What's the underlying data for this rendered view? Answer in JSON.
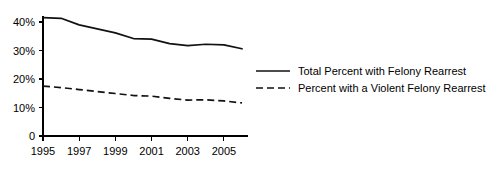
{
  "chart_data": {
    "type": "line",
    "title": "",
    "xlabel": "",
    "ylabel": "",
    "grid": false,
    "legend_position": "right",
    "x": [
      1995,
      1996,
      1997,
      1998,
      1999,
      2000,
      2001,
      2002,
      2003,
      2004,
      2005,
      2006
    ],
    "xlim": [
      1995,
      2006
    ],
    "ylim": [
      0,
      42
    ],
    "x_tick_labels": [
      "1995",
      "1997",
      "1999",
      "2001",
      "2003",
      "2005"
    ],
    "x_tick_values": [
      1995,
      1997,
      1999,
      2001,
      2003,
      2005
    ],
    "y_tick_labels": [
      "0",
      "10%",
      "20%",
      "30%",
      "40%"
    ],
    "y_tick_values": [
      0,
      10,
      20,
      30,
      40
    ],
    "series": [
      {
        "name": "Total Percent with Felony Rearrest",
        "style": "solid",
        "color": "#111111",
        "values": [
          41.5,
          41.3,
          39.0,
          37.6,
          36.2,
          34.2,
          34.0,
          32.4,
          31.7,
          32.2,
          32.0,
          30.6
        ]
      },
      {
        "name": "Percent with a Violent Felony Rearrest",
        "style": "dashed",
        "color": "#111111",
        "values": [
          17.5,
          17.0,
          16.3,
          15.6,
          14.9,
          14.2,
          14.0,
          13.2,
          12.6,
          12.7,
          12.3,
          11.6
        ]
      }
    ]
  },
  "legend": {
    "items": [
      {
        "label": "Total Percent with Felony Rearrest",
        "style": "solid"
      },
      {
        "label": "Percent with a Violent Felony Rearrest",
        "style": "dashed"
      }
    ]
  }
}
